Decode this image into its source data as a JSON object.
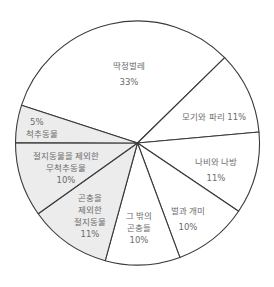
{
  "chart_data": {
    "type": "pie",
    "title": "",
    "categories": [
      "딱정벌레",
      "모기와 파리",
      "나비와 나방",
      "벌과 개미",
      "그 밖의 곤충들",
      "곤충을 제외한 절지동물",
      "절지동물을 제외한 무척추동물",
      "척추동물"
    ],
    "values": [
      33,
      11,
      11,
      10,
      10,
      11,
      10,
      5
    ],
    "value_labels": [
      "33%",
      "11%",
      "11%",
      "10%",
      "10%",
      "11%",
      "10%",
      "5%"
    ],
    "slice_colors": [
      "#ffffff",
      "#ffffff",
      "#ffffff",
      "#ffffff",
      "#ffffff",
      "#ececec",
      "#ececec",
      "#ececec"
    ],
    "unit": "%",
    "legend": "none"
  },
  "labels": {
    "beetles": {
      "name": "딱정벌레",
      "pct": "33%"
    },
    "flies": {
      "name": "모기와 파리",
      "pct": "11%"
    },
    "butterflies": {
      "name": "나비와 나방",
      "pct": "11%"
    },
    "bees": {
      "name": "벌과 개미",
      "pct": "10%"
    },
    "other_insects": {
      "line1": "그 밖의",
      "line2": "곤충들",
      "pct": "10%"
    },
    "non_insect_arthropods": {
      "line1": "곤충을",
      "line2": "제외한",
      "line3": "절지동물",
      "pct": "11%"
    },
    "non_arthropod_invertebrates": {
      "line1": "절지동물을 제외한",
      "line2": "무척추동물",
      "pct": "10%"
    },
    "vertebrates": {
      "pct": "5%",
      "name": "척추동물"
    }
  },
  "colors": {
    "stroke": "#3a3a3a",
    "shaded": "#ececec",
    "text": "#6b6b6b"
  }
}
